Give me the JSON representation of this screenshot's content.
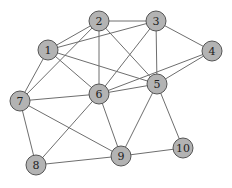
{
  "graph": {
    "node_fill": "#b3b3b3",
    "node_stroke": "#555555",
    "edge_color": "#6e6e6e",
    "node_radius": 10,
    "nodes": [
      {
        "id": "1",
        "label": "1",
        "x": 48,
        "y": 50
      },
      {
        "id": "2",
        "label": "2",
        "x": 99,
        "y": 21
      },
      {
        "id": "3",
        "label": "3",
        "x": 156,
        "y": 21
      },
      {
        "id": "4",
        "label": "4",
        "x": 212,
        "y": 51
      },
      {
        "id": "5",
        "label": "5",
        "x": 157,
        "y": 84
      },
      {
        "id": "6",
        "label": "6",
        "x": 99,
        "y": 94
      },
      {
        "id": "7",
        "label": "7",
        "x": 20,
        "y": 101
      },
      {
        "id": "8",
        "label": "8",
        "x": 36,
        "y": 165
      },
      {
        "id": "9",
        "label": "9",
        "x": 121,
        "y": 156
      },
      {
        "id": "10",
        "label": "10",
        "x": 183,
        "y": 148
      }
    ],
    "edges": [
      [
        "1",
        "2"
      ],
      [
        "1",
        "3"
      ],
      [
        "1",
        "6"
      ],
      [
        "1",
        "5"
      ],
      [
        "1",
        "7"
      ],
      [
        "2",
        "3"
      ],
      [
        "2",
        "6"
      ],
      [
        "2",
        "5"
      ],
      [
        "2",
        "7"
      ],
      [
        "3",
        "4"
      ],
      [
        "3",
        "5"
      ],
      [
        "3",
        "6"
      ],
      [
        "4",
        "5"
      ],
      [
        "4",
        "6"
      ],
      [
        "5",
        "6"
      ],
      [
        "5",
        "9"
      ],
      [
        "5",
        "10"
      ],
      [
        "6",
        "7"
      ],
      [
        "6",
        "8"
      ],
      [
        "6",
        "9"
      ],
      [
        "7",
        "8"
      ],
      [
        "7",
        "9"
      ],
      [
        "8",
        "9"
      ],
      [
        "9",
        "10"
      ]
    ]
  }
}
